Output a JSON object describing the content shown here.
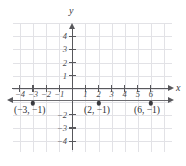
{
  "figure": {
    "type": "coordinate-plane",
    "background_color": "#ffffff",
    "grid_color": "#e2e2e6",
    "axis_color": "#58585c",
    "line_color": "#6c6c70",
    "point_color": "#3a3a3e"
  },
  "axes": {
    "x_label": "x",
    "y_label": "y",
    "x_ticks": [
      {
        "value": -4,
        "label": "−4"
      },
      {
        "value": -3,
        "label": "−3"
      },
      {
        "value": -2,
        "label": "−2"
      },
      {
        "value": -1,
        "label": "−1"
      },
      {
        "value": 1,
        "label": "1"
      },
      {
        "value": 2,
        "label": "2"
      },
      {
        "value": 3,
        "label": "3"
      },
      {
        "value": 4,
        "label": "4"
      },
      {
        "value": 5,
        "label": "5"
      },
      {
        "value": 6,
        "label": "6"
      }
    ],
    "y_ticks": [
      {
        "value": 4,
        "label": "4"
      },
      {
        "value": 3,
        "label": "3"
      },
      {
        "value": 2,
        "label": "2"
      },
      {
        "value": 1,
        "label": "1"
      },
      {
        "value": -2,
        "label": "−2"
      },
      {
        "value": -3,
        "label": "−3"
      },
      {
        "value": -4,
        "label": "−4"
      }
    ]
  },
  "chart_data": {
    "type": "scatter",
    "title": "",
    "xlabel": "x",
    "ylabel": "y",
    "xlim": [
      -5,
      7
    ],
    "ylim": [
      -5,
      5
    ],
    "grid": true,
    "legend": "none",
    "series": [
      {
        "name": "horizontal line y = -1",
        "type": "line",
        "equation": "y = −1",
        "x": [
          -5,
          7
        ],
        "y": [
          -1,
          -1
        ],
        "arrows": "both"
      },
      {
        "name": "plotted points",
        "type": "scatter",
        "points": [
          {
            "x": -3,
            "y": -1,
            "label": "(−3, −1)"
          },
          {
            "x": 2,
            "y": -1,
            "label": "(2, −1)"
          },
          {
            "x": 6,
            "y": -1,
            "label": "(6, −1)"
          }
        ]
      }
    ],
    "annotations": [
      {
        "text": "(−3, −1)",
        "x": -3,
        "y": -1.9
      },
      {
        "text": "(2, −1)",
        "x": 2,
        "y": -1.9
      },
      {
        "text": "(6, −1)",
        "x": 6,
        "y": -1.9
      }
    ]
  },
  "point_labels": [
    "(−3, −1)",
    "(2, −1)",
    "(6, −1)"
  ]
}
